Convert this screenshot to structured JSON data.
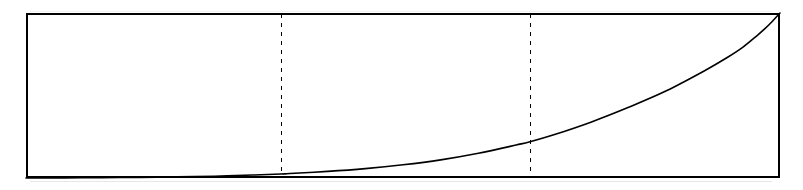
{
  "figure": {
    "title": "",
    "background_color": "#ffffff",
    "line_color": "#000000",
    "frame_color": "#000000",
    "dashed_line_color": "#000000"
  },
  "chart_data": {
    "type": "line",
    "title": "",
    "subtitle": "",
    "xlabel": "",
    "ylabel": "",
    "xlim": [
      0,
      1
    ],
    "ylim": [
      0,
      1
    ],
    "grid": false,
    "legend": null,
    "legend_position": "none",
    "frame": {
      "left": 26,
      "right": 780,
      "top": 13,
      "bottom": 178,
      "stroke_width": 2
    },
    "series": [
      {
        "name": "curve",
        "style": "solid",
        "stroke_width": 1.6,
        "color": "#000000",
        "x": [
          0.0,
          0.05,
          0.1,
          0.15,
          0.2,
          0.25,
          0.3,
          0.3382,
          0.35,
          0.4,
          0.45,
          0.5,
          0.55,
          0.6,
          0.65,
          0.6684,
          0.7,
          0.75,
          0.8,
          0.85,
          0.9,
          0.93,
          0.95,
          0.97,
          0.98,
          0.99,
          1.0
        ],
        "y": [
          0.0,
          0.001,
          0.002,
          0.004,
          0.007,
          0.011,
          0.018,
          0.024,
          0.027,
          0.04,
          0.057,
          0.08,
          0.11,
          0.15,
          0.2,
          0.22,
          0.262,
          0.34,
          0.43,
          0.53,
          0.65,
          0.73,
          0.79,
          0.865,
          0.905,
          0.95,
          1.0
        ]
      }
    ],
    "annotations": [
      {
        "type": "vertical-dashed-line",
        "name": "first-dashed-line",
        "x_pixel": 281,
        "x_value": 0.338,
        "dash_pattern": "4 5",
        "stroke_width": 1.4
      },
      {
        "type": "vertical-dashed-line",
        "name": "second-dashed-line",
        "x_pixel": 530,
        "x_value": 0.668,
        "dash_pattern": "4 5",
        "stroke_width": 1.4
      }
    ]
  }
}
